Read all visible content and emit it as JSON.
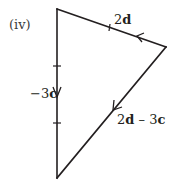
{
  "figure": {
    "part_label": "(iv)",
    "shape": "triangle",
    "edges": [
      {
        "id": "top",
        "from": "right",
        "to": "top-left",
        "vector": "2d",
        "label_bold": "d",
        "label_coef": "2",
        "arrow_direction": "left",
        "tick_marks": 1
      },
      {
        "id": "left",
        "from": "top-left",
        "to": "bottom",
        "vector": "-3c",
        "label_prefix": "−3",
        "label_bold": "c",
        "arrow_direction": "down",
        "tick_marks": 2
      },
      {
        "id": "hypotenuse",
        "from": "right",
        "to": "bottom",
        "vector": "2d - 3c",
        "arrow_direction": "down-left",
        "tick_marks": 0
      }
    ],
    "labels": {
      "top": {
        "coef": "2",
        "vec": "d"
      },
      "left": {
        "coef": "−3",
        "vec": "c"
      },
      "hyp": {
        "coef1": "2",
        "vec1": "d",
        "op": " – ",
        "coef2": "3",
        "vec2": "c"
      }
    },
    "color": "#231f20"
  }
}
